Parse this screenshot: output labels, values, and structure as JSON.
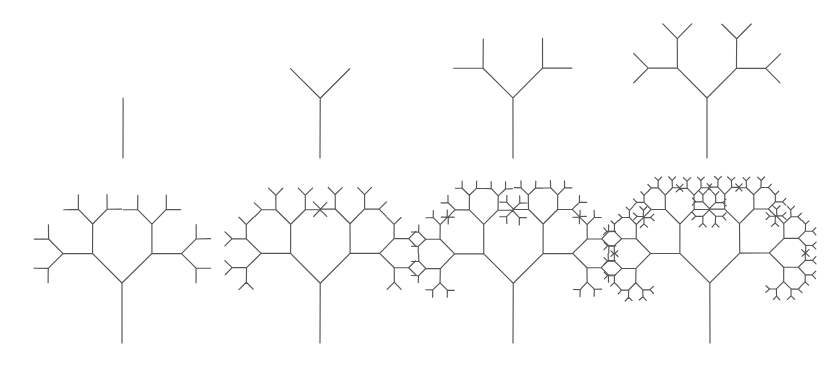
{
  "figure": {
    "width": 826,
    "height": 378,
    "background_color": "#ffffff",
    "stroke_color": "#555555",
    "stroke_width": 1.15,
    "rows": 2,
    "columns": 4
  },
  "chart_data": {
    "type": "diagram",
    "subtype": "recursive-binary-fractal-tree-series",
    "panel_count": 8,
    "grid": {
      "rows": 2,
      "columns": 4,
      "order": "left-to-right-top-to-bottom"
    },
    "geometry": {
      "branch_half_angle_deg": 45,
      "length_scale_ratio": 0.7,
      "initial_trunk_length": 60,
      "initial_direction_deg": 90,
      "children_per_node": 2,
      "stroke_color": "#555555",
      "stroke_width": 1.15,
      "background_color": "#ffffff"
    },
    "panels": [
      {
        "index": 1,
        "depth": 1,
        "base_x": 123,
        "base_y": 158,
        "trunk_length": 60,
        "segment_count": 3
      },
      {
        "index": 2,
        "depth": 2,
        "base_x": 320,
        "base_y": 158,
        "trunk_length": 60,
        "segment_count": 7
      },
      {
        "index": 3,
        "depth": 3,
        "base_x": 513,
        "base_y": 158,
        "trunk_length": 60,
        "segment_count": 15
      },
      {
        "index": 4,
        "depth": 4,
        "base_x": 707,
        "base_y": 158,
        "trunk_length": 60,
        "segment_count": 31
      },
      {
        "index": 5,
        "depth": 5,
        "base_x": 122,
        "base_y": 343,
        "trunk_length": 60,
        "segment_count": 63
      },
      {
        "index": 6,
        "depth": 6,
        "base_x": 320,
        "base_y": 343,
        "trunk_length": 60,
        "segment_count": 127
      },
      {
        "index": 7,
        "depth": 7,
        "base_x": 513,
        "base_y": 343,
        "trunk_length": 60,
        "segment_count": 255
      },
      {
        "index": 8,
        "depth": 8,
        "base_x": 710,
        "base_y": 343,
        "trunk_length": 60,
        "segment_count": 511
      }
    ],
    "xlabel": "",
    "ylabel": "",
    "legend": [],
    "annotations": []
  }
}
